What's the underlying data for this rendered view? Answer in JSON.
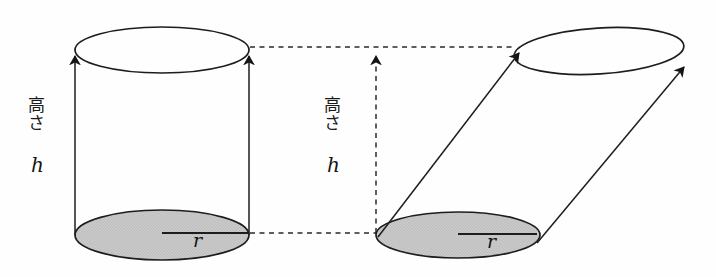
{
  "figure": {
    "background_color": "#fefefe",
    "stroke_color": "#1a1a1a",
    "fill_gray": "#c9c9c9",
    "dash_color": "#2a2a2a"
  },
  "left_solid": {
    "name": "right-circular-cylinder",
    "height_label_japanese": "高さ",
    "height_label_variable": "h",
    "radius_label": "r"
  },
  "right_solid": {
    "name": "oblique-cylinder",
    "height_label_japanese": "高さ",
    "height_label_variable": "h",
    "radius_label": "r"
  }
}
